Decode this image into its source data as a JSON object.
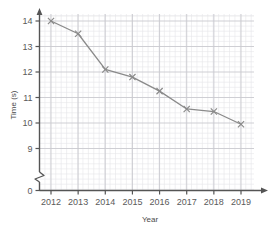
{
  "chart_data": {
    "type": "line",
    "title": "",
    "xlabel": "Year",
    "ylabel": "Time (s)",
    "categories": [
      "2012",
      "2013",
      "2014",
      "2015",
      "2016",
      "2017",
      "2018",
      "2019"
    ],
    "x": [
      2012,
      2013,
      2014,
      2015,
      2016,
      2017,
      2018,
      2019
    ],
    "values": [
      14.0,
      13.5,
      12.1,
      11.8,
      11.25,
      10.55,
      10.45,
      9.95
    ],
    "series": [
      {
        "name": "Time",
        "values": [
          14.0,
          13.5,
          12.1,
          11.8,
          11.25,
          10.55,
          10.45,
          9.95
        ]
      }
    ],
    "xlim": [
      2012,
      2019
    ],
    "ylim": [
      8.75,
      14.4
    ],
    "ytick_labels": [
      "0",
      "9",
      "10",
      "11",
      "12",
      "13",
      "14"
    ],
    "ytick_values": [
      0,
      9,
      10,
      11,
      12,
      13,
      14
    ],
    "xtick_labels": [
      "2012",
      "2013",
      "2014",
      "2015",
      "2016",
      "2017",
      "2018",
      "2019"
    ],
    "grid": true,
    "minor_grid": true,
    "minor_divisions": 5,
    "axis_break": "y-axis between 0 and 9",
    "marker": "x",
    "legend": false,
    "legend_position": "none"
  },
  "style": {
    "line_color": "#8a8a8a",
    "marker_color": "#8a8a8a",
    "axis_color": "#555555",
    "major_grid_color": "#c9c9cf",
    "minor_grid_color": "#e6e6ea",
    "label_color": "#5a5a5a",
    "background": "#ffffff"
  }
}
